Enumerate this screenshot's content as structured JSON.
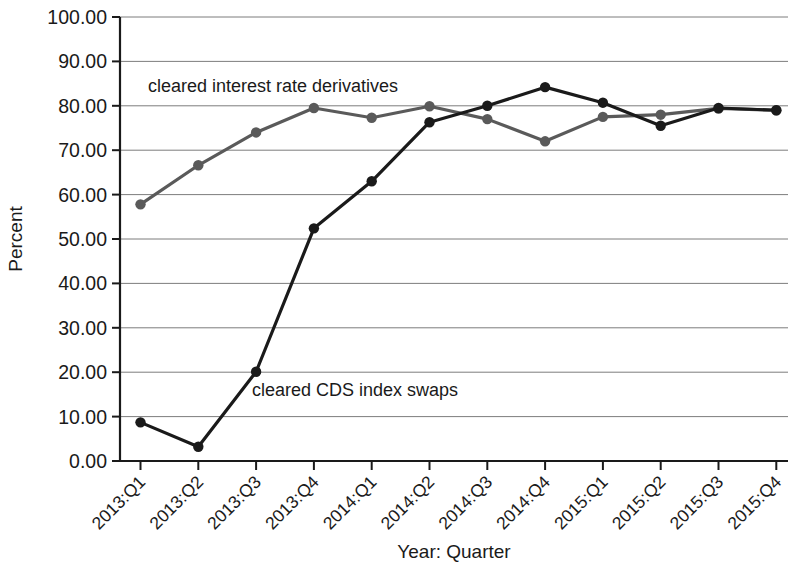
{
  "chart_data": {
    "type": "line",
    "title": "",
    "xlabel": "Year: Quarter",
    "ylabel": "Percent",
    "categories": [
      "2013:Q1",
      "2013:Q2",
      "2013:Q3",
      "2013:Q4",
      "2014:Q1",
      "2014:Q2",
      "2014:Q3",
      "2014:Q4",
      "2015:Q1",
      "2015:Q2",
      "2015:Q3",
      "2015:Q4"
    ],
    "ylim": [
      0,
      100
    ],
    "ytick_values": [
      0,
      10,
      20,
      30,
      40,
      50,
      60,
      70,
      80,
      90,
      100
    ],
    "ytick_labels": [
      "0.00",
      "10.00",
      "20.00",
      "30.00",
      "40.00",
      "50.00",
      "60.00",
      "70.00",
      "80.00",
      "90.00",
      "100.00"
    ],
    "grid": true,
    "legend_position": "inline-annotations",
    "series": [
      {
        "name": "cleared interest rate derivatives",
        "color": "#5a5a5a",
        "marker": "circle",
        "values": [
          57.8,
          66.6,
          74.0,
          79.5,
          77.3,
          79.9,
          77.0,
          72.0,
          77.5,
          78.0,
          79.4,
          79.0
        ]
      },
      {
        "name": "cleared CDS index swaps",
        "color": "#1a1a1a",
        "marker": "circle",
        "values": [
          8.7,
          3.2,
          20.1,
          52.4,
          63.0,
          76.3,
          80.0,
          84.2,
          80.7,
          75.5,
          79.5,
          79.0
        ]
      }
    ],
    "annotations": [
      {
        "text": "cleared interest rate derivatives",
        "x_px": 148,
        "y_px": 92
      },
      {
        "text": "cleared CDS index swaps",
        "x_px": 252,
        "y_px": 396
      }
    ]
  },
  "axis": {
    "x_title": "Year: Quarter",
    "y_title": "Percent"
  }
}
